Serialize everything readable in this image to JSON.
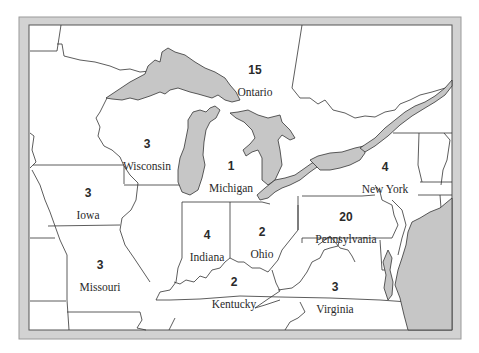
{
  "map": {
    "colors": {
      "frame": "#cfcfcf",
      "frame_edge": "#8c8c8c",
      "land": "#ffffff",
      "water": "#c8c8c8",
      "border": "#333333"
    },
    "regions": [
      {
        "name": "Ontario",
        "count": "15",
        "x": 255,
        "y": 63
      },
      {
        "name": "Wisconsin",
        "count": "3",
        "x": 147,
        "y": 137
      },
      {
        "name": "Michigan",
        "count": "1",
        "x": 231,
        "y": 159
      },
      {
        "name": "New York",
        "count": "4",
        "x": 385,
        "y": 160
      },
      {
        "name": "Iowa",
        "count": "3",
        "x": 88,
        "y": 186
      },
      {
        "name": "Indiana",
        "count": "4",
        "x": 207,
        "y": 228
      },
      {
        "name": "Ohio",
        "count": "2",
        "x": 262,
        "y": 225
      },
      {
        "name": "Pennsylvania",
        "count": "20",
        "x": 346,
        "y": 210
      },
      {
        "name": "Missouri",
        "count": "3",
        "x": 100,
        "y": 258
      },
      {
        "name": "Kentucky",
        "count": "2",
        "x": 234,
        "y": 275
      },
      {
        "name": "Virginia",
        "count": "3",
        "x": 335,
        "y": 280
      }
    ]
  }
}
